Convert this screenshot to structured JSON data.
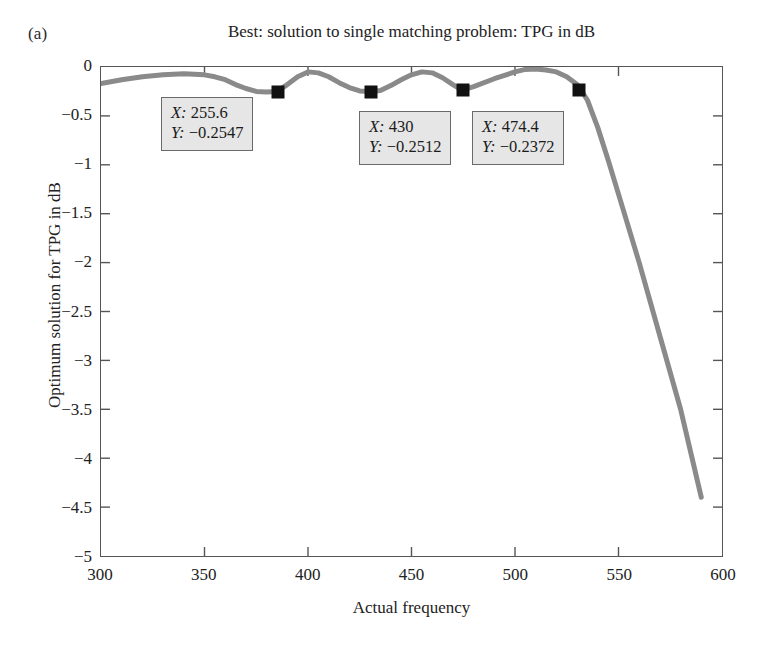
{
  "panel_label": "(a)",
  "chart_data": {
    "type": "line",
    "title": "Best: solution to single matching problem: TPG in dB",
    "xlabel": "Actual frequency",
    "ylabel": "Optimum solution for TPG in dB",
    "xlim": [
      300,
      600
    ],
    "ylim": [
      -5,
      0
    ],
    "xticks": [
      300,
      350,
      400,
      450,
      500,
      550,
      600
    ],
    "yticks": [
      0,
      -0.5,
      -1,
      -1.5,
      -2,
      -2.5,
      -3,
      -3.5,
      -4,
      -4.5,
      -5
    ],
    "ytick_labels": [
      "0",
      "−0.5",
      "−1",
      "−1.5",
      "−2",
      "−2.5",
      "−3",
      "−3.5",
      "−4",
      "−4.5",
      "−5"
    ],
    "xtick_labels": [
      "300",
      "350",
      "400",
      "450",
      "500",
      "550",
      "600"
    ],
    "grid": false,
    "legend": "none",
    "line_color": "#8a8a8a",
    "marker_color": "#111111",
    "series": [
      {
        "name": "TPG in dB",
        "x": [
          300,
          310,
          320,
          330,
          340,
          350,
          355,
          360,
          365,
          370,
          375,
          380,
          385,
          390,
          395,
          400,
          405,
          410,
          415,
          420,
          425,
          430,
          435,
          440,
          445,
          450,
          455,
          460,
          465,
          470,
          474.4,
          480,
          490,
          500,
          505,
          510,
          515,
          520,
          525,
          530,
          532,
          535,
          540,
          545,
          550,
          560,
          570,
          580,
          585,
          590
        ],
        "y": [
          -0.17,
          -0.13,
          -0.1,
          -0.08,
          -0.07,
          -0.08,
          -0.1,
          -0.13,
          -0.18,
          -0.22,
          -0.25,
          -0.255,
          -0.25,
          -0.18,
          -0.1,
          -0.05,
          -0.06,
          -0.1,
          -0.16,
          -0.21,
          -0.245,
          -0.2512,
          -0.24,
          -0.19,
          -0.13,
          -0.08,
          -0.05,
          -0.06,
          -0.11,
          -0.18,
          -0.2372,
          -0.2,
          -0.12,
          -0.05,
          -0.025,
          -0.02,
          -0.03,
          -0.05,
          -0.1,
          -0.18,
          -0.2372,
          -0.34,
          -0.62,
          -0.95,
          -1.3,
          -2.0,
          -2.75,
          -3.5,
          -3.95,
          -4.4
        ]
      }
    ],
    "markers": [
      {
        "x": 385.0,
        "y": -0.2547
      },
      {
        "x": 430.0,
        "y": -0.2512
      },
      {
        "x": 474.4,
        "y": -0.2372
      },
      {
        "x": 530.0,
        "y": -0.2372
      }
    ],
    "annotations": [
      {
        "id": "datatip-1",
        "x_label": "X:",
        "x_value": "255.6",
        "y_label": "Y:",
        "y_value": "−0.2547"
      },
      {
        "id": "datatip-2",
        "x_label": "X:",
        "x_value": "430",
        "y_label": "Y:",
        "y_value": "−0.2512"
      },
      {
        "id": "datatip-3",
        "x_label": "X:",
        "x_value": "474.4",
        "y_label": "Y:",
        "y_value": "−0.2372"
      }
    ]
  }
}
